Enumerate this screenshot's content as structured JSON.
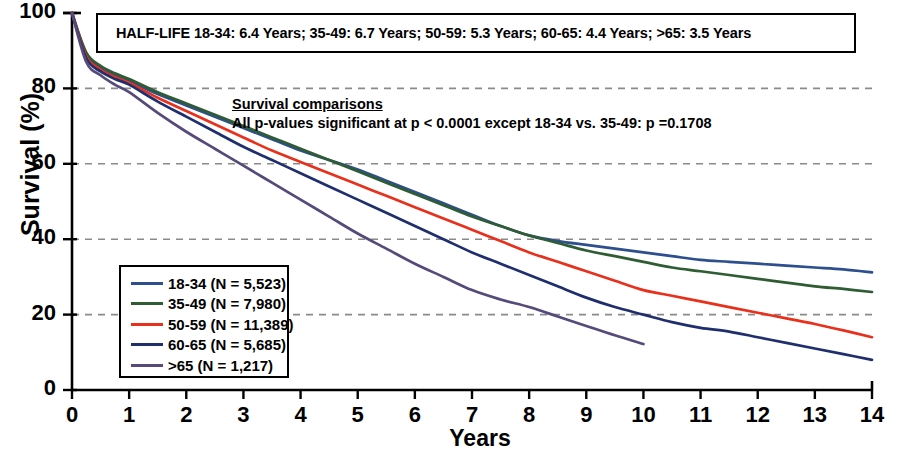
{
  "chart_data": {
    "type": "line",
    "title": "",
    "xlabel": "Years",
    "ylabel": "Survival (%)",
    "xlim": [
      0,
      14
    ],
    "ylim": [
      0,
      100
    ],
    "xticks": [
      "0",
      "1",
      "2",
      "3",
      "4",
      "5",
      "6",
      "7",
      "8",
      "9",
      "10",
      "11",
      "12",
      "13",
      "14"
    ],
    "yticks": [
      "0",
      "20",
      "40",
      "60",
      "80",
      "100"
    ],
    "grid": "horizontal dashed gray at 20,40,60,80",
    "legend_position": "inside lower-left",
    "series": [
      {
        "name": "18-34 (N = 5,523)",
        "label": "18-34",
        "n": "5,523",
        "color": "#2d4f8f",
        "half_life_years": 6.4,
        "x": [
          0,
          0.25,
          0.5,
          0.75,
          1,
          1.5,
          2,
          2.5,
          3,
          3.5,
          4,
          4.5,
          5,
          5.5,
          6,
          6.5,
          7,
          7.5,
          8,
          8.5,
          9,
          9.5,
          10,
          10.5,
          11,
          11.5,
          12,
          12.5,
          13,
          13.5,
          14
        ],
        "y": [
          100,
          89,
          85.5,
          83.5,
          82,
          78.5,
          75.5,
          72.5,
          69.5,
          66.5,
          63.5,
          61,
          58.5,
          55.5,
          52.5,
          49.5,
          46.5,
          43.5,
          41,
          39.5,
          38.5,
          37.5,
          36.5,
          35.5,
          34.5,
          34,
          33.5,
          33,
          32.5,
          32,
          31.2
        ]
      },
      {
        "name": "35-49 (N = 7,980)",
        "label": "35-49",
        "n": "7,980",
        "color": "#2e5c33",
        "half_life_years": 6.7,
        "x": [
          0,
          0.25,
          0.5,
          0.75,
          1,
          1.5,
          2,
          2.5,
          3,
          3.5,
          4,
          4.5,
          5,
          5.5,
          6,
          6.5,
          7,
          7.5,
          8,
          8.5,
          9,
          9.5,
          10,
          10.5,
          11,
          11.5,
          12,
          12.5,
          13,
          13.5,
          14
        ],
        "y": [
          100,
          89.5,
          86,
          84,
          82.5,
          79,
          76,
          73,
          70,
          67,
          64,
          61,
          58,
          55,
          52,
          49,
          46,
          43.5,
          41,
          39,
          37,
          35.5,
          34,
          32.5,
          31.5,
          30.5,
          29.5,
          28.5,
          27.5,
          26.8,
          26
        ]
      },
      {
        "name": "50-59 (N = 11,389)",
        "label": "50-59",
        "n": "11,389",
        "color": "#e8301c",
        "half_life_years": 5.3,
        "x": [
          0,
          0.25,
          0.5,
          0.75,
          1,
          1.5,
          2,
          2.5,
          3,
          3.5,
          4,
          4.5,
          5,
          5.5,
          6,
          6.5,
          7,
          7.5,
          8,
          8.5,
          9,
          9.5,
          10,
          10.5,
          11,
          11.5,
          12,
          12.5,
          13,
          13.5,
          14
        ],
        "y": [
          100,
          88.5,
          85,
          83,
          81.5,
          77.5,
          74,
          70.5,
          67,
          63.5,
          60.5,
          57.5,
          54.5,
          51.5,
          48.5,
          45.5,
          42.5,
          39.5,
          36.5,
          34,
          31.5,
          29,
          26.5,
          25,
          23.5,
          22,
          20.5,
          19,
          17.5,
          15.8,
          14
        ]
      },
      {
        "name": "60-65 (N = 5,685)",
        "label": "60-65",
        "n": "5,685",
        "color": "#1f2f6e",
        "half_life_years": 4.4,
        "x": [
          0,
          0.25,
          0.5,
          0.75,
          1,
          1.5,
          2,
          2.5,
          3,
          3.5,
          4,
          4.5,
          5,
          5.5,
          6,
          6.5,
          7,
          7.5,
          8,
          8.5,
          9,
          9.5,
          10,
          10.5,
          11,
          11.5,
          12,
          12.5,
          13,
          13.5,
          14
        ],
        "y": [
          100,
          88,
          84.5,
          82.5,
          81,
          76.5,
          72.5,
          68.5,
          64.5,
          61,
          57.5,
          54,
          50.5,
          47,
          43.5,
          40,
          36.5,
          33.5,
          30.5,
          27.5,
          24.5,
          22,
          20,
          18,
          16.5,
          15.5,
          14,
          12.5,
          11,
          9.5,
          8
        ]
      },
      {
        "name": ">65 (N = 1,217)",
        "label": ">65",
        "n": "1,217",
        "color": "#554a7a",
        "half_life_years": 3.5,
        "x": [
          0,
          0.25,
          0.5,
          0.75,
          1,
          1.5,
          2,
          2.5,
          3,
          3.5,
          4,
          4.5,
          5,
          5.5,
          6,
          6.5,
          7,
          7.5,
          8,
          8.5,
          9,
          9.5,
          10
        ],
        "y": [
          100,
          87,
          83.5,
          81,
          79,
          73.5,
          68.5,
          64,
          59.5,
          55,
          50.5,
          46,
          41.5,
          37.5,
          33.5,
          30,
          26.5,
          24,
          22,
          19.5,
          17,
          14.5,
          12.2
        ]
      }
    ]
  },
  "annotations": {
    "half_life": {
      "text": "HALF-LIFE   18-34: 6.4 Years; 35-49: 6.7 Years; 50-59: 5.3 Years; 60-65: 4.4 Years; >65: 3.5 Years"
    },
    "comparisons": {
      "title": "Survival comparisons",
      "body": "All p-values significant at p < 0.0001 except 18-34 vs. 35-49: p =0.1708"
    }
  }
}
